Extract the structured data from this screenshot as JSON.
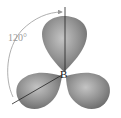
{
  "diagram": {
    "central_atom": "B",
    "angle_label": "120°",
    "lobes": 3,
    "colors": {
      "lobe_light": "#bdbdbd",
      "lobe_mid": "#8e8e8e",
      "lobe_dark": "#6a6a6a",
      "axis_line": "#222222",
      "arc": "#9a9a9a"
    }
  }
}
